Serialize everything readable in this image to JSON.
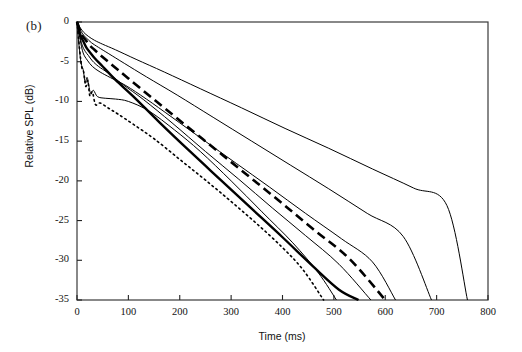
{
  "figure": {
    "panel_label": "(b)",
    "xlabel": "Time (ms)",
    "ylabel": "Relative SPL (dB)"
  },
  "chart_data": {
    "type": "line",
    "title": "",
    "subtitle": "",
    "panel": "(b)",
    "xlabel": "Time (ms)",
    "ylabel": "Relative SPL (dB)",
    "xlim": [
      0,
      800
    ],
    "ylim": [
      -35,
      0
    ],
    "xticks": [
      0,
      100,
      200,
      300,
      400,
      500,
      600,
      700,
      800
    ],
    "yticks": [
      0,
      -5,
      -10,
      -15,
      -20,
      -25,
      -30,
      -35
    ],
    "xtick_labels": [
      "0",
      "100",
      "200",
      "300",
      "400",
      "500",
      "600",
      "700",
      "800"
    ],
    "ytick_labels": [
      "0",
      "-5",
      "-10",
      "-15",
      "-20",
      "-25",
      "-30",
      "-35"
    ],
    "grid": false,
    "legend": null,
    "legend_position": "none",
    "frame": "box",
    "series": [
      {
        "name": "decay-dotted-fastest",
        "style": "dotted",
        "width": 1.6,
        "color": "#000000",
        "decay_end_ms": 480,
        "x": [
          0,
          5,
          9,
          13,
          17,
          21,
          25,
          30,
          36,
          45,
          60,
          80,
          110,
          150,
          200,
          250,
          300,
          350,
          400,
          440,
          480
        ],
        "y": [
          0,
          -3.4,
          -5.6,
          -6.3,
          -8.1,
          -7.4,
          -9.3,
          -8.8,
          -10.4,
          -10.2,
          -10.8,
          -11.6,
          -12.9,
          -14.7,
          -17.3,
          -19.9,
          -22.6,
          -25.4,
          -28.4,
          -31.2,
          -35
        ]
      },
      {
        "name": "decay-thin-solid-fast",
        "style": "solid",
        "width": 1.0,
        "color": "#000000",
        "decay_end_ms": 505,
        "x": [
          0,
          4,
          8,
          12,
          16,
          20,
          26,
          32,
          40,
          55,
          75,
          100,
          140,
          190,
          240,
          300,
          360,
          420,
          470,
          505
        ],
        "y": [
          0,
          -3.0,
          -5.2,
          -6.0,
          -7.6,
          -7.0,
          -8.9,
          -8.6,
          -9.4,
          -9.6,
          -9.7,
          -10.0,
          -11.2,
          -13.6,
          -16.3,
          -20.0,
          -23.9,
          -27.8,
          -31.6,
          -35
        ]
      },
      {
        "name": "decay-thick-solid",
        "style": "solid",
        "width": 2.4,
        "color": "#000000",
        "decay_end_ms": 548,
        "x": [
          0,
          4,
          8,
          12,
          18,
          25,
          35,
          50,
          75,
          110,
          160,
          220,
          280,
          340,
          400,
          460,
          510,
          548
        ],
        "y": [
          0,
          -1.0,
          -1.9,
          -2.4,
          -3.2,
          -3.8,
          -4.6,
          -5.6,
          -7.3,
          -9.4,
          -12.6,
          -16.3,
          -19.9,
          -23.5,
          -27.1,
          -30.8,
          -33.7,
          -35
        ]
      },
      {
        "name": "decay-thin-solid-mid",
        "style": "solid",
        "width": 1.0,
        "color": "#000000",
        "decay_end_ms": 572,
        "x": [
          0,
          5,
          10,
          16,
          22,
          30,
          42,
          60,
          90,
          130,
          185,
          250,
          315,
          380,
          445,
          510,
          572
        ],
        "y": [
          0,
          -1.6,
          -2.9,
          -3.7,
          -4.2,
          -4.9,
          -5.6,
          -6.4,
          -7.9,
          -9.8,
          -12.7,
          -16.3,
          -19.8,
          -23.4,
          -26.9,
          -30.5,
          -35
        ]
      },
      {
        "name": "decay-thick-dashed",
        "style": "dashed",
        "width": 2.6,
        "color": "#000000",
        "decay_end_ms": 600,
        "x": [
          0,
          5,
          10,
          16,
          24,
          34,
          48,
          70,
          100,
          145,
          200,
          265,
          330,
          395,
          460,
          530,
          600
        ],
        "y": [
          0,
          -0.9,
          -1.7,
          -2.2,
          -2.9,
          -3.5,
          -4.3,
          -5.5,
          -7.1,
          -9.5,
          -12.4,
          -15.8,
          -19.2,
          -22.6,
          -26.1,
          -29.8,
          -35
        ]
      },
      {
        "name": "decay-thin-solid-slow-a",
        "style": "solid",
        "width": 1.0,
        "color": "#000000",
        "decay_end_ms": 620,
        "x": [
          0,
          6,
          12,
          20,
          30,
          45,
          65,
          95,
          135,
          185,
          245,
          310,
          375,
          445,
          515,
          575,
          620
        ],
        "y": [
          0,
          -2.2,
          -3.9,
          -4.8,
          -5.6,
          -6.3,
          -7.0,
          -8.0,
          -9.7,
          -12.0,
          -14.8,
          -17.8,
          -20.8,
          -24.1,
          -27.3,
          -30.2,
          -35
        ]
      },
      {
        "name": "decay-thin-solid-slow-b",
        "style": "solid",
        "width": 1.0,
        "color": "#000000",
        "decay_end_ms": 690,
        "x": [
          0,
          5,
          11,
          18,
          28,
          42,
          62,
          92,
          135,
          195,
          265,
          340,
          415,
          490,
          565,
          635,
          690
        ],
        "y": [
          0,
          -0.8,
          -1.5,
          -2.0,
          -2.6,
          -3.2,
          -4.0,
          -5.2,
          -6.9,
          -9.2,
          -12.0,
          -15.0,
          -18.0,
          -21.0,
          -24.1,
          -27.0,
          -35
        ]
      },
      {
        "name": "decay-thin-solid-slowest",
        "style": "solid",
        "width": 1.0,
        "color": "#000000",
        "decay_end_ms": 760,
        "x": [
          0,
          6,
          13,
          22,
          34,
          50,
          75,
          115,
          170,
          240,
          320,
          405,
          490,
          575,
          655,
          720,
          760
        ],
        "y": [
          0,
          -0.7,
          -1.3,
          -1.8,
          -2.3,
          -2.8,
          -3.5,
          -4.7,
          -6.3,
          -8.4,
          -10.8,
          -13.4,
          -15.9,
          -18.5,
          -20.9,
          -23.1,
          -35
        ]
      }
    ]
  }
}
